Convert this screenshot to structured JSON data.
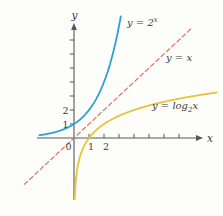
{
  "figure": {
    "background": "#fdfdf9"
  },
  "chart_data": {
    "type": "line",
    "grid": false,
    "x_range": [
      -2.5,
      8.6
    ],
    "y_range": [
      -4.8,
      8.5
    ],
    "x_axis": {
      "label": "x",
      "ticks": [
        1,
        2,
        3,
        4,
        5,
        6,
        7
      ],
      "labeled_ticks": [
        {
          "value": 1,
          "label": "1"
        },
        {
          "value": 2,
          "label": "2"
        }
      ]
    },
    "y_axis": {
      "label": "y",
      "ticks": [
        1,
        2,
        3,
        4,
        5,
        6,
        7
      ],
      "labeled_ticks": [
        {
          "value": 1,
          "label": "1"
        },
        {
          "value": 2,
          "label": "2"
        }
      ]
    },
    "origin_label": "0",
    "series": [
      {
        "id": "exp2",
        "label": "y = 2^x",
        "fn": "exp2",
        "domain": [
          -2.3,
          3.12
        ],
        "color": "#2f9ed6",
        "line_style": "solid",
        "key_points": [
          [
            -2,
            0.25
          ],
          [
            -1,
            0.5
          ],
          [
            0,
            1
          ],
          [
            1,
            2
          ],
          [
            2,
            4
          ],
          [
            3,
            8
          ]
        ]
      },
      {
        "id": "identity",
        "label": "y = x",
        "fn": "identity",
        "domain": [
          -3.3,
          7.9
        ],
        "color": "#dd7365",
        "line_style": "dashed",
        "key_points": [
          [
            -3,
            -3
          ],
          [
            0,
            0
          ],
          [
            3,
            3
          ],
          [
            7,
            7
          ]
        ]
      },
      {
        "id": "log2",
        "label": "y = log2(x)",
        "fn": "log2",
        "domain": [
          0.048,
          9.5
        ],
        "color": "#e7c33e",
        "line_style": "solid",
        "key_points": [
          [
            0.25,
            -2
          ],
          [
            0.5,
            -1
          ],
          [
            1,
            0
          ],
          [
            2,
            1
          ],
          [
            4,
            2
          ],
          [
            8,
            3
          ]
        ]
      }
    ],
    "annotations": [
      {
        "id": "exp2-label",
        "prefix": "y = 2",
        "sup": "x"
      },
      {
        "id": "identity-label",
        "text": "y = x"
      },
      {
        "id": "log2-label",
        "prefix": "y = log",
        "sub": "2",
        "suffix": "x"
      }
    ]
  }
}
